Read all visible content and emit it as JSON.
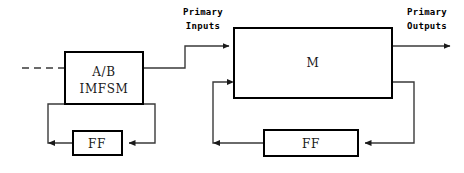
{
  "diagram": {
    "canvas": {
      "width": 464,
      "height": 173,
      "background": "#ffffff"
    },
    "colors": {
      "box_stroke": "#000000",
      "wire_stroke": "#3a3a3a",
      "text": "#1a1a1a",
      "label_text": "#000000"
    },
    "blocks": [
      {
        "id": "ab-imfsm",
        "name": "ab-imfsm-block",
        "lines": [
          "A/B",
          "IMFSM"
        ],
        "x": 65,
        "y": 52,
        "width": 78,
        "height": 52
      },
      {
        "id": "machine-m",
        "name": "machine-m-block",
        "lines": [
          "M"
        ],
        "x": 234,
        "y": 28,
        "width": 158,
        "height": 70
      },
      {
        "id": "ff-left",
        "name": "ff-left-block",
        "lines": [
          "FF"
        ],
        "x": 73,
        "y": 131,
        "width": 49,
        "height": 24
      },
      {
        "id": "ff-right",
        "name": "ff-right-block",
        "lines": [
          "FF"
        ],
        "x": 264,
        "y": 130,
        "width": 94,
        "height": 26
      }
    ],
    "labels": [
      {
        "id": "primary-inputs",
        "name": "primary-inputs-label",
        "line1": "Primary",
        "line2": "Inputs",
        "x": 203,
        "y": 13
      },
      {
        "id": "primary-outputs",
        "name": "primary-outputs-label",
        "line1": "Primary",
        "line2": "Outputs",
        "x": 427,
        "y": 13
      }
    ],
    "wires": [
      {
        "id": "dashed-input",
        "name": "dashed-input-wire",
        "style": "dashed",
        "path": "M 22 68 L 65 68"
      },
      {
        "id": "ab-to-m",
        "name": "ab-to-m-wire",
        "style": "solid-arrow",
        "path": "M 143 68 L 185 68 L 185 46 L 229 46"
      },
      {
        "id": "m-to-output",
        "name": "m-primary-output-wire",
        "style": "solid-arrow",
        "path": "M 392 46 L 452 46"
      },
      {
        "id": "m-to-ffright",
        "name": "m-to-ff-right-wire",
        "style": "solid-arrow",
        "path": "M 392 82 L 414 82 L 414 143 L 363 143"
      },
      {
        "id": "ffright-to-m",
        "name": "ff-right-to-m-wire",
        "style": "solid-arrow",
        "path": "M 264 143 L 213 143 L 213 82 L 234 82"
      },
      {
        "id": "ab-to-ffleft",
        "name": "ab-to-ff-left-wire",
        "style": "solid-arrow",
        "path": "M 143 104 L 155 104 L 155 143 L 127 143"
      },
      {
        "id": "ffleft-to-ab",
        "name": "ff-left-to-ab-wire",
        "style": "solid-arrow",
        "path": "M 73 143 L 48 143 L 48 104 L 65 104"
      }
    ]
  }
}
